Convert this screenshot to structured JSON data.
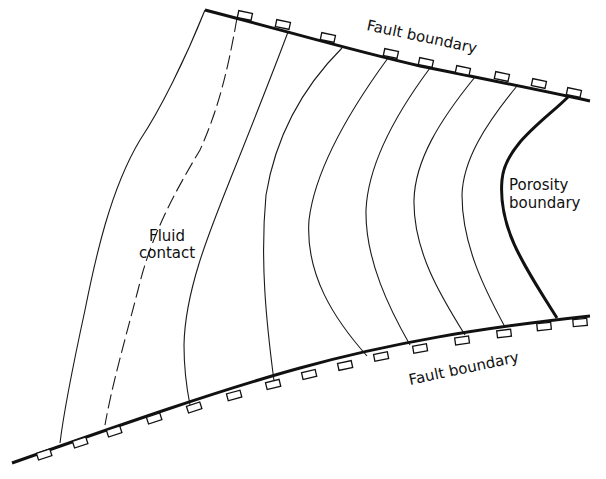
{
  "diagram": {
    "type": "structure-contour map of fault-bounded reservoir",
    "labels": {
      "top_fault": "Fault boundary",
      "bottom_fault": "Fault boundary",
      "fluid_contact_line1": "Fluid",
      "fluid_contact_line2": "contact",
      "porosity_line1": "Porosity",
      "porosity_line2": "boundary"
    },
    "elements": {
      "fault_boundaries": 2,
      "contour_lines": 7,
      "dashed_fluid_contact": 1,
      "porosity_boundary": 1
    },
    "colors": {
      "line": "#111111",
      "background": "#ffffff"
    }
  }
}
